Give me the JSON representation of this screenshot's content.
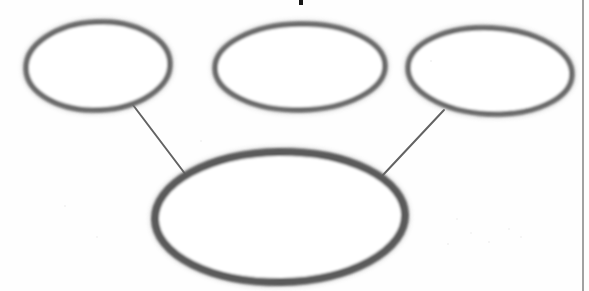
{
  "page": {
    "width": 589,
    "height": 291,
    "background_color": "#fefefe",
    "media": "scanned-worksheet"
  },
  "diagram": {
    "type": "concept-web",
    "name": "cluster-diagram",
    "stroke_color": "#6a6a6a",
    "stroke_color_dark": "#5a5a5a",
    "fill_color": "#ffffff",
    "nodes": [
      {
        "id": "oval-top-left",
        "name": "oval-top-left",
        "label": "",
        "cx": 98,
        "cy": 66,
        "rx": 72,
        "ry": 44,
        "rotation": -2.5,
        "stroke_width": 5.5,
        "role": "supporting-idea"
      },
      {
        "id": "oval-top-middle",
        "name": "oval-top-middle",
        "label": "",
        "cx": 300,
        "cy": 67,
        "rx": 85,
        "ry": 43,
        "rotation": -1,
        "stroke_width": 5.5,
        "role": "supporting-idea"
      },
      {
        "id": "oval-top-right",
        "name": "oval-top-right",
        "label": "",
        "cx": 490,
        "cy": 71,
        "rx": 82,
        "ry": 43,
        "rotation": 3,
        "stroke_width": 5.5,
        "role": "supporting-idea"
      },
      {
        "id": "oval-center-main",
        "name": "oval-center-main",
        "label": "",
        "cx": 280,
        "cy": 217,
        "rx": 125,
        "ry": 65,
        "rotation": -1,
        "stroke_width": 8,
        "role": "main-idea"
      }
    ],
    "connectors": [
      {
        "id": "connector-left",
        "name": "connector-left",
        "from": "oval-top-left",
        "to": "oval-center-main",
        "x1": 133,
        "y1": 105,
        "x2": 186,
        "y2": 175,
        "stroke_width": 2
      },
      {
        "id": "connector-middle",
        "name": "connector-middle",
        "from": "oval-top-middle",
        "to": "oval-center-main",
        "x1": 291,
        "y1": 109,
        "x2": 291,
        "y2": 159,
        "stroke_width": 2.4
      },
      {
        "id": "connector-right",
        "name": "connector-right",
        "from": "oval-top-right",
        "to": "oval-center-main",
        "x1": 444,
        "y1": 110,
        "x2": 383,
        "y2": 175,
        "stroke_width": 2
      }
    ]
  },
  "page_marks": {
    "right_border_rule": {
      "name": "page-border-rule",
      "x": 583,
      "y1": 0,
      "y2": 291,
      "color": "#8a8a8a",
      "width": 1.6
    },
    "cropped_glyph": {
      "name": "cropped-glyph-fragment",
      "x": 299,
      "y": 0,
      "width": 4,
      "height": 5,
      "color": "#171717",
      "note": "bottom fragment of a cut-off character from the line above"
    },
    "specks": [
      {
        "x": 456,
        "y": 218,
        "size": 2
      },
      {
        "x": 470,
        "y": 232,
        "size": 2
      },
      {
        "x": 488,
        "y": 241,
        "size": 1.5
      },
      {
        "x": 508,
        "y": 228,
        "size": 1.5
      },
      {
        "x": 520,
        "y": 236,
        "size": 2
      },
      {
        "x": 447,
        "y": 243,
        "size": 1.5
      },
      {
        "x": 64,
        "y": 205,
        "size": 1.5
      },
      {
        "x": 96,
        "y": 236,
        "size": 2
      },
      {
        "x": 430,
        "y": 60,
        "size": 1.5
      },
      {
        "x": 200,
        "y": 140,
        "size": 1.5
      }
    ]
  }
}
